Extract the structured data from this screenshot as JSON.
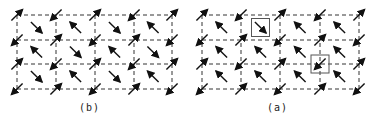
{
  "panels": [
    {
      "id": "b",
      "label": "(b)",
      "x_lines": [
        17,
        56,
        95,
        134,
        172
      ],
      "y_lines": [
        15,
        40,
        64,
        89
      ],
      "corner_spin": "up-right/down-left",
      "cell_spin": "down-right",
      "highlights": []
    },
    {
      "id": "a",
      "label": "(a)",
      "x_lines": [
        202,
        241,
        280,
        320,
        359
      ],
      "y_lines": [
        15,
        40,
        64,
        89
      ],
      "corner_spin": "up-right/down-left",
      "cell_spin": "up-left",
      "highlights": [
        {
          "type": "cell",
          "row": 0,
          "col": 1,
          "spin": "down-right"
        },
        {
          "type": "vertex",
          "row": 2,
          "col": 3,
          "spin": "up-right"
        }
      ]
    }
  ],
  "colors": {
    "line": "#333333",
    "arrow": "#111111",
    "box": "#555555"
  }
}
